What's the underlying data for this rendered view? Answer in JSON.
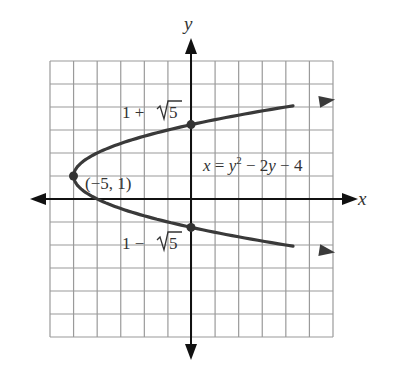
{
  "chart_data": {
    "type": "line",
    "title": "",
    "xlabel": "x",
    "ylabel": "y",
    "xlim": [
      -6,
      6
    ],
    "ylim": [
      -6,
      6
    ],
    "grid": true,
    "grid_step": 1,
    "equation": "x = y² − 2y − 4",
    "series": [
      {
        "name": "x = y^2 - 2y - 4",
        "curve": "parabola opening right",
        "points": [
          {
            "x": 6,
            "y": 4.32
          },
          {
            "x": 4,
            "y": 3.83
          },
          {
            "x": 0,
            "y": 3.236
          },
          {
            "x": -2,
            "y": 2.732
          },
          {
            "x": -4,
            "y": 2.0
          },
          {
            "x": -5,
            "y": 1.0
          },
          {
            "x": -4,
            "y": 0.0
          },
          {
            "x": -2,
            "y": -0.732
          },
          {
            "x": 0,
            "y": -1.236
          },
          {
            "x": 4,
            "y": -1.83
          },
          {
            "x": 6,
            "y": -2.32
          }
        ]
      }
    ],
    "marked_points": [
      {
        "x": -5,
        "y": 1,
        "label": "(−5, 1)"
      },
      {
        "x": 0,
        "y": 3.236,
        "label": "1 + √5"
      },
      {
        "x": 0,
        "y": -1.236,
        "label": "1 − √5"
      }
    ]
  },
  "labels": {
    "x_axis": "x",
    "y_axis": "y",
    "vertex": "(−5, 1)",
    "upper_intercept_prefix": "1 + ",
    "upper_intercept_root": "5",
    "lower_intercept_prefix": "1 − ",
    "lower_intercept_root": "5",
    "eq_x": "x",
    "eq_eq": " = ",
    "eq_y": "y",
    "eq_sup": "2",
    "eq_mid": " − 2",
    "eq_y2": "y",
    "eq_end": " − 4"
  },
  "colors": {
    "grid": "#9a9a9a",
    "axis": "#111111",
    "curve": "#3a3a3a",
    "text": "#333333"
  }
}
